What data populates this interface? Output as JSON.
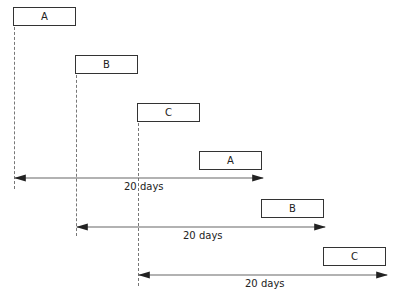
{
  "diagram": {
    "type": "staggered-schedule",
    "tasks_row1": [
      {
        "label": "A"
      },
      {
        "label": "B"
      },
      {
        "label": "C"
      }
    ],
    "tasks_row2": [
      {
        "label": "A"
      },
      {
        "label": "B"
      },
      {
        "label": "C"
      }
    ],
    "spans": [
      {
        "label": "20 days"
      },
      {
        "label": "20 days"
      },
      {
        "label": "20 days"
      }
    ],
    "colors": {
      "stroke": "#333333",
      "arrow": "#555555",
      "dash": "#777777",
      "background": "#ffffff"
    }
  }
}
